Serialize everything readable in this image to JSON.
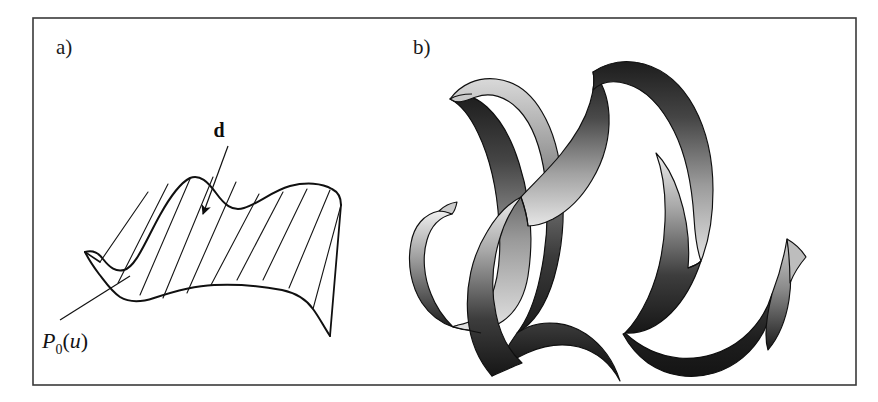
{
  "figure": {
    "background_color": "#ffffff",
    "frame": {
      "name": "figure-border",
      "x": 33,
      "y": 18,
      "width": 823,
      "height": 367,
      "stroke_color": "#3a3a3a",
      "stroke_width": 1.6
    },
    "panels": [
      {
        "id": "a",
        "label": "a)",
        "label_x": 56,
        "label_y": 54,
        "caption": "Ruled surface generated by sweeping the profile curve along direction d"
      },
      {
        "id": "b",
        "label": "b)",
        "label_x": 413,
        "label_y": 54,
        "caption": "Resulting serpentine shaded ribbon surface"
      }
    ],
    "annotations": {
      "direction_vector": {
        "name": "direction-vector-d",
        "text": "d",
        "text_x": 224,
        "text_y": 137,
        "leader_from_x": 228,
        "leader_from_y": 146,
        "leader_to_x": 205,
        "leader_to_y": 208,
        "arrow_tip_x": 201,
        "arrow_tip_y": 222,
        "style": "bold-serif"
      },
      "profile_curve": {
        "name": "profile-curve-label",
        "base": "P",
        "subscript": "0",
        "open_paren": "(",
        "variable": "u",
        "close_paren": ")",
        "text_x": 42,
        "text_y": 344,
        "leader_from_x": 56,
        "leader_from_y": 322,
        "leader_to_x": 128,
        "leader_to_y": 277,
        "style": "italic-serif-math"
      }
    },
    "colors": {
      "ink": "#111111",
      "frame": "#3a3a3a",
      "ribbon_dark": "#1c1c1c",
      "ribbon_mid": "#6e6e6e",
      "ribbon_light": "#d8d8d8",
      "ribbon_edge": "#0f0f0f",
      "paper": "#ffffff"
    },
    "panel_a_surface": {
      "name": "ruled-surface",
      "ruling_line_count": 9,
      "ruling_stroke_width": 1.1,
      "outline_stroke_width": 1.9,
      "description": "Wavy profile curve extruded along a slanted straight direction forming a ruled surface"
    },
    "panel_b_ribbon": {
      "name": "serpentine-ribbon",
      "loop_count": 3,
      "shading": "vertical gradient dark-to-light per band segment",
      "description": "Sinuous twisted ribbon with two full S-loops and curled end tails"
    }
  }
}
